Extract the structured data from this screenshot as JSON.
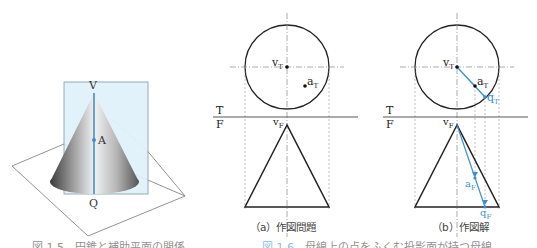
{
  "colors": {
    "line": "#222222",
    "guide": "#8a8a8a",
    "accent": "#3a8fd4",
    "plane_fill": "#dff1fb",
    "plane_stroke": "#7a9aa8"
  },
  "figure_left": {
    "labels": {
      "apex": "V",
      "point": "A",
      "base": "Q"
    }
  },
  "figure_a": {
    "labels": {
      "vT": "v",
      "vT_sub": "T",
      "aT": "a",
      "aT_sub": "T",
      "T": "T",
      "F": "F",
      "vF": "v",
      "vF_sub": "F"
    },
    "caption": "（a）作図問題"
  },
  "figure_b": {
    "labels": {
      "vT": "v",
      "vT_sub": "T",
      "aT": "a",
      "aT_sub": "T",
      "qT": "q",
      "qT_sub": "T",
      "T": "T",
      "F": "F",
      "vF": "v",
      "vF_sub": "F",
      "aF": "a",
      "aF_sub": "F",
      "qF": "q",
      "qF_sub": "F"
    },
    "caption": "（b）作図解"
  },
  "bottom_captions": {
    "left": "図 1.5　円錐と補助平面の関係",
    "right_num": "図 1.6",
    "right": "　母線上の点をふくむ投影面が持つ母線"
  }
}
